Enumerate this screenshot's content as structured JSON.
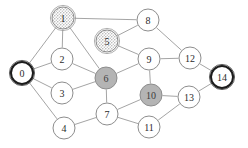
{
  "figure": {
    "name": "undirected-graph",
    "background_color": "#ffffff",
    "width": 248,
    "height": 148
  },
  "style": {
    "edge_color": "#9a9a9a",
    "node_fill_plain": "#ffffff",
    "node_fill_gray": "#b4b4b4",
    "node_stroke": "#8d8d8d",
    "node_stroke_bold": "#1c1c1c",
    "label_color": "#2b2b2b",
    "node_radius": 11
  },
  "chart_data": {
    "type": "diagram",
    "title": "",
    "nodes": [
      {
        "id": "0",
        "label": "0",
        "x": 22,
        "y": 73,
        "r": 11,
        "fill": "plain",
        "border": "bold",
        "double_ring": true
      },
      {
        "id": "1",
        "label": "1",
        "x": 63,
        "y": 18,
        "r": 11,
        "fill": "dotted",
        "border": "normal",
        "double_ring": true
      },
      {
        "id": "2",
        "label": "2",
        "x": 62,
        "y": 59,
        "r": 11,
        "fill": "plain",
        "border": "normal",
        "double_ring": false
      },
      {
        "id": "3",
        "label": "3",
        "x": 62,
        "y": 93,
        "r": 11,
        "fill": "plain",
        "border": "normal",
        "double_ring": false
      },
      {
        "id": "4",
        "label": "4",
        "x": 64,
        "y": 128,
        "r": 11,
        "fill": "plain",
        "border": "normal",
        "double_ring": false
      },
      {
        "id": "5",
        "label": "5",
        "x": 107,
        "y": 41,
        "r": 11,
        "fill": "dotted",
        "border": "normal",
        "double_ring": true
      },
      {
        "id": "6",
        "label": "6",
        "x": 106,
        "y": 78,
        "r": 11,
        "fill": "gray",
        "border": "normal",
        "double_ring": false
      },
      {
        "id": "7",
        "label": "7",
        "x": 107,
        "y": 114,
        "r": 11,
        "fill": "plain",
        "border": "normal",
        "double_ring": false
      },
      {
        "id": "8",
        "label": "8",
        "x": 148,
        "y": 20,
        "r": 11,
        "fill": "plain",
        "border": "normal",
        "double_ring": false
      },
      {
        "id": "9",
        "label": "9",
        "x": 149,
        "y": 59,
        "r": 11,
        "fill": "plain",
        "border": "normal",
        "double_ring": false
      },
      {
        "id": "10",
        "label": "10",
        "x": 151,
        "y": 95,
        "r": 11,
        "fill": "gray",
        "border": "normal",
        "double_ring": false
      },
      {
        "id": "11",
        "label": "11",
        "x": 149,
        "y": 127,
        "r": 11,
        "fill": "plain",
        "border": "normal",
        "double_ring": false
      },
      {
        "id": "12",
        "label": "12",
        "x": 190,
        "y": 58,
        "r": 11,
        "fill": "plain",
        "border": "normal",
        "double_ring": false
      },
      {
        "id": "13",
        "label": "13",
        "x": 189,
        "y": 97,
        "r": 11,
        "fill": "plain",
        "border": "normal",
        "double_ring": false
      },
      {
        "id": "14",
        "label": "14",
        "x": 222,
        "y": 77,
        "r": 11,
        "fill": "plain",
        "border": "bold",
        "double_ring": true
      }
    ],
    "edges": [
      {
        "source": "0",
        "target": "1"
      },
      {
        "source": "0",
        "target": "2"
      },
      {
        "source": "0",
        "target": "3"
      },
      {
        "source": "0",
        "target": "4"
      },
      {
        "source": "1",
        "target": "2"
      },
      {
        "source": "1",
        "target": "6"
      },
      {
        "source": "1",
        "target": "8"
      },
      {
        "source": "2",
        "target": "6"
      },
      {
        "source": "3",
        "target": "6"
      },
      {
        "source": "4",
        "target": "7"
      },
      {
        "source": "5",
        "target": "8"
      },
      {
        "source": "5",
        "target": "9"
      },
      {
        "source": "6",
        "target": "7"
      },
      {
        "source": "6",
        "target": "9"
      },
      {
        "source": "7",
        "target": "10"
      },
      {
        "source": "7",
        "target": "11"
      },
      {
        "source": "8",
        "target": "12"
      },
      {
        "source": "9",
        "target": "10"
      },
      {
        "source": "9",
        "target": "12"
      },
      {
        "source": "10",
        "target": "13"
      },
      {
        "source": "11",
        "target": "13"
      },
      {
        "source": "12",
        "target": "14"
      },
      {
        "source": "13",
        "target": "14"
      }
    ],
    "legend": [],
    "annotations": []
  }
}
